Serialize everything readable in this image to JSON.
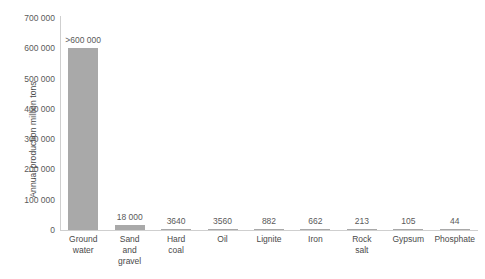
{
  "chart_data": {
    "type": "bar",
    "title": "",
    "subtitle": "",
    "xlabel": "",
    "ylabel": "Annual production million tons",
    "ylim": [
      0,
      700000
    ],
    "grid": false,
    "legend": "none",
    "y_ticks": [
      "0",
      "100 000",
      "200 000",
      "300 000",
      "400 000",
      "500 000",
      "600 000",
      "700 000"
    ],
    "y_tick_values": [
      0,
      100000,
      200000,
      300000,
      400000,
      500000,
      600000,
      700000
    ],
    "categories": [
      "Ground water",
      "Sand and gravel",
      "Hard coal",
      "Oil",
      "Lignite",
      "Iron",
      "Rock salt",
      "Gypsum",
      "Phosphate"
    ],
    "category_lines": [
      [
        "Ground",
        "water"
      ],
      [
        "Sand",
        "and",
        "gravel"
      ],
      [
        "Hard",
        "coal"
      ],
      [
        "Oil"
      ],
      [
        "Lignite"
      ],
      [
        "Iron"
      ],
      [
        "Rock",
        "salt"
      ],
      [
        "Gypsum"
      ],
      [
        "Phosphate"
      ]
    ],
    "values": [
      600000,
      18000,
      3640,
      3560,
      882,
      662,
      213,
      105,
      44
    ],
    "data_labels": [
      ">600 000",
      "18 000",
      "3640",
      "3560",
      "882",
      "662",
      "213",
      "105",
      "44"
    ],
    "bar_color": "#a9a9a9",
    "axis_color": "#cfcfcf",
    "text_color": "#4a4a4a"
  }
}
